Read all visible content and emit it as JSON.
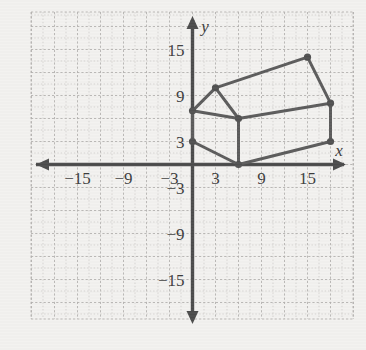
{
  "figure": {
    "background_color": "#f3f2f0",
    "axis_color": "#4a4a4a",
    "grid_color": "#c9c7c4",
    "shape_color": "#5a5a5a"
  },
  "axes": {
    "x_label": "x",
    "y_label": "y",
    "x_ticks": [
      {
        "label": "−15",
        "value": -15
      },
      {
        "label": "−9",
        "value": -9
      },
      {
        "label": "−3",
        "value": -3
      },
      {
        "label": "3",
        "value": 3
      },
      {
        "label": "9",
        "value": 9
      },
      {
        "label": "15",
        "value": 15
      }
    ],
    "y_ticks": [
      {
        "label": "15",
        "value": 15
      },
      {
        "label": "9",
        "value": 9
      },
      {
        "label": "3",
        "value": 3
      },
      {
        "label": "−3",
        "value": -3
      },
      {
        "label": "−9",
        "value": -9
      },
      {
        "label": "−15",
        "value": -15
      }
    ]
  },
  "chart_data": {
    "type": "scatter",
    "title": "",
    "xlabel": "x",
    "ylabel": "y",
    "xlim": [
      -21,
      21
    ],
    "ylim": [
      -21,
      21
    ],
    "grid": true,
    "grid_step": 3,
    "legend": "none",
    "vertices": [
      {
        "name": "front-left-lower",
        "x": 0,
        "y": 3
      },
      {
        "name": "front-left-upper",
        "x": 0,
        "y": 7
      },
      {
        "name": "roof-peak-front",
        "x": 3,
        "y": 10
      },
      {
        "name": "front-eave",
        "x": 6,
        "y": 6
      },
      {
        "name": "front-bottom",
        "x": 6,
        "y": 0
      },
      {
        "name": "roof-peak-back",
        "x": 15,
        "y": 14
      },
      {
        "name": "back-eave",
        "x": 18,
        "y": 8
      },
      {
        "name": "back-bottom",
        "x": 18,
        "y": 3
      }
    ],
    "edges": [
      [
        "front-left-lower",
        "front-left-upper"
      ],
      [
        "front-left-upper",
        "roof-peak-front"
      ],
      [
        "roof-peak-front",
        "front-eave"
      ],
      [
        "front-left-upper",
        "front-eave"
      ],
      [
        "front-eave",
        "front-bottom"
      ],
      [
        "front-left-lower",
        "front-bottom"
      ],
      [
        "roof-peak-front",
        "roof-peak-back"
      ],
      [
        "roof-peak-back",
        "back-eave"
      ],
      [
        "front-eave",
        "back-eave"
      ],
      [
        "back-eave",
        "back-bottom"
      ],
      [
        "front-bottom",
        "back-bottom"
      ]
    ]
  }
}
